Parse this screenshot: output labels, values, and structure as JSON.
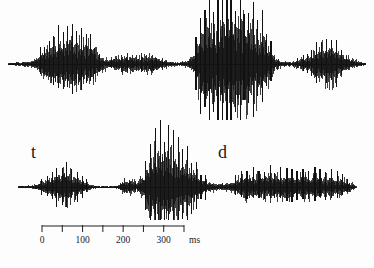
{
  "figure": {
    "title": "",
    "background_color": "#fdfdfd",
    "trace_color": "#111111"
  },
  "annotations": {
    "top_label": "",
    "bottom_label_left": "t",
    "bottom_label_right": "d"
  },
  "axis": {
    "unit": "ms",
    "min_ms": 0,
    "max_ms": 350,
    "tick_interval_ms": 50,
    "tick_values": [
      0,
      50,
      100,
      150,
      200,
      250,
      300,
      350
    ],
    "labeled_ticks": [
      "0",
      "",
      "100",
      "",
      "200",
      "",
      "300",
      ""
    ],
    "x_start_px": 42,
    "x_end_px": 184,
    "line_color": "#202020"
  },
  "chart_data": {
    "type": "line",
    "title": "",
    "xlabel": "ms",
    "ylabel": "",
    "grid": false,
    "legend": false,
    "xlim": [
      0,
      350
    ],
    "series": [
      {
        "name": "waveform-top",
        "baseline_y_px": 64,
        "x_start_px": 8,
        "x_end_px": 366,
        "envelope": [
          {
            "x": 8,
            "a": 1.5
          },
          {
            "x": 18,
            "a": 2.0
          },
          {
            "x": 28,
            "a": 3.0
          },
          {
            "x": 36,
            "a": 5.0
          },
          {
            "x": 42,
            "a": 14.0
          },
          {
            "x": 48,
            "a": 20.0
          },
          {
            "x": 55,
            "a": 24.0
          },
          {
            "x": 62,
            "a": 26.0
          },
          {
            "x": 70,
            "a": 27.0
          },
          {
            "x": 78,
            "a": 26.0
          },
          {
            "x": 86,
            "a": 23.0
          },
          {
            "x": 94,
            "a": 17.0
          },
          {
            "x": 100,
            "a": 9.0
          },
          {
            "x": 108,
            "a": 5.0
          },
          {
            "x": 116,
            "a": 7.0
          },
          {
            "x": 124,
            "a": 9.0
          },
          {
            "x": 132,
            "a": 9.0
          },
          {
            "x": 140,
            "a": 8.0
          },
          {
            "x": 148,
            "a": 10.0
          },
          {
            "x": 155,
            "a": 8.0
          },
          {
            "x": 162,
            "a": 5.0
          },
          {
            "x": 170,
            "a": 3.0
          },
          {
            "x": 178,
            "a": 2.0
          },
          {
            "x": 186,
            "a": 3.0
          },
          {
            "x": 194,
            "a": 10.0
          },
          {
            "x": 200,
            "a": 34.0
          },
          {
            "x": 208,
            "a": 44.0
          },
          {
            "x": 216,
            "a": 48.0
          },
          {
            "x": 224,
            "a": 50.0
          },
          {
            "x": 232,
            "a": 50.0
          },
          {
            "x": 240,
            "a": 49.0
          },
          {
            "x": 248,
            "a": 47.0
          },
          {
            "x": 256,
            "a": 44.0
          },
          {
            "x": 262,
            "a": 36.0
          },
          {
            "x": 268,
            "a": 22.0
          },
          {
            "x": 274,
            "a": 8.0
          },
          {
            "x": 282,
            "a": 3.0
          },
          {
            "x": 292,
            "a": 2.5
          },
          {
            "x": 300,
            "a": 6.0
          },
          {
            "x": 308,
            "a": 7.0
          },
          {
            "x": 316,
            "a": 16.0
          },
          {
            "x": 322,
            "a": 20.0
          },
          {
            "x": 330,
            "a": 22.0
          },
          {
            "x": 338,
            "a": 16.0
          },
          {
            "x": 346,
            "a": 8.0
          },
          {
            "x": 354,
            "a": 4.0
          },
          {
            "x": 362,
            "a": 2.0
          },
          {
            "x": 366,
            "a": 1.0
          }
        ]
      },
      {
        "name": "waveform-bottom",
        "baseline_y_px": 187,
        "x_start_px": 18,
        "x_end_px": 356,
        "envelope": [
          {
            "x": 18,
            "a": 1.0
          },
          {
            "x": 28,
            "a": 1.5
          },
          {
            "x": 36,
            "a": 3.0
          },
          {
            "x": 44,
            "a": 7.0
          },
          {
            "x": 50,
            "a": 9.0
          },
          {
            "x": 56,
            "a": 14.0
          },
          {
            "x": 62,
            "a": 18.0
          },
          {
            "x": 68,
            "a": 17.0
          },
          {
            "x": 74,
            "a": 12.0
          },
          {
            "x": 80,
            "a": 9.0
          },
          {
            "x": 86,
            "a": 5.0
          },
          {
            "x": 92,
            "a": 2.0
          },
          {
            "x": 100,
            "a": 1.0
          },
          {
            "x": 110,
            "a": 1.0
          },
          {
            "x": 118,
            "a": 2.0
          },
          {
            "x": 124,
            "a": 7.0
          },
          {
            "x": 130,
            "a": 8.0
          },
          {
            "x": 136,
            "a": 6.0
          },
          {
            "x": 142,
            "a": 10.0
          },
          {
            "x": 148,
            "a": 28.0
          },
          {
            "x": 154,
            "a": 38.0
          },
          {
            "x": 160,
            "a": 42.0
          },
          {
            "x": 166,
            "a": 40.0
          },
          {
            "x": 172,
            "a": 34.0
          },
          {
            "x": 178,
            "a": 30.0
          },
          {
            "x": 184,
            "a": 26.0
          },
          {
            "x": 190,
            "a": 22.0
          },
          {
            "x": 196,
            "a": 16.0
          },
          {
            "x": 202,
            "a": 10.0
          },
          {
            "x": 208,
            "a": 6.0
          },
          {
            "x": 216,
            "a": 4.0
          },
          {
            "x": 224,
            "a": 4.0
          },
          {
            "x": 232,
            "a": 5.0
          },
          {
            "x": 240,
            "a": 11.0
          },
          {
            "x": 248,
            "a": 13.0
          },
          {
            "x": 256,
            "a": 13.0
          },
          {
            "x": 264,
            "a": 13.0
          },
          {
            "x": 272,
            "a": 13.0
          },
          {
            "x": 280,
            "a": 13.0
          },
          {
            "x": 288,
            "a": 13.0
          },
          {
            "x": 296,
            "a": 13.0
          },
          {
            "x": 304,
            "a": 13.0
          },
          {
            "x": 312,
            "a": 12.0
          },
          {
            "x": 320,
            "a": 12.0
          },
          {
            "x": 328,
            "a": 11.0
          },
          {
            "x": 336,
            "a": 10.0
          },
          {
            "x": 344,
            "a": 8.0
          },
          {
            "x": 350,
            "a": 5.0
          },
          {
            "x": 356,
            "a": 1.0
          }
        ]
      }
    ]
  }
}
